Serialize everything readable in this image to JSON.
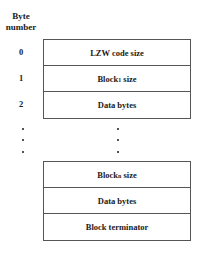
{
  "header": {
    "line1": "Byte",
    "line2": "number"
  },
  "byte_numbers": [
    "0",
    "1",
    "2"
  ],
  "top_block": [
    {
      "label": "LZW code size"
    },
    {
      "label": "Block",
      "subscript": "1",
      "suffix": " size"
    },
    {
      "label": "Data bytes"
    }
  ],
  "bottom_block": [
    {
      "label": "Block",
      "subscript": "n",
      "suffix": " size"
    },
    {
      "label": "Data bytes"
    },
    {
      "label": "Block terminator"
    }
  ],
  "ellipsis": "vertical dots"
}
